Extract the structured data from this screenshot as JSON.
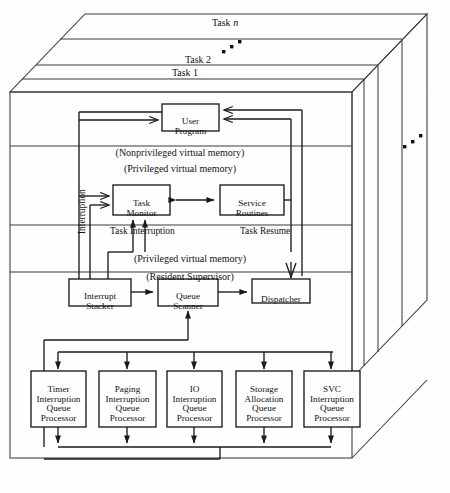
{
  "figure": {
    "kind": "layered-3d-architecture-diagram",
    "title_present": false
  },
  "stack": {
    "task_labels": [
      {
        "id": "task-n",
        "text": "Task",
        "suffix": "n",
        "italic_suffix": true
      },
      {
        "id": "task-2",
        "text": "Task 2"
      },
      {
        "id": "task-1",
        "text": "Task 1"
      }
    ],
    "ellipsis_marks": [
      "▪",
      "▪",
      "▪"
    ]
  },
  "memory_bands": [
    {
      "id": "nonpriv-virtual-memory",
      "text": "(Nonprivileged virtual memory)"
    },
    {
      "id": "priv-virtual-memory-upper",
      "text": "(Privileged virtual memory)"
    },
    {
      "id": "priv-virtual-memory-lower",
      "text": "(Privileged virtual memory)"
    },
    {
      "id": "resident-supervisor",
      "text": "(Resident Supervisor)"
    }
  ],
  "boxes": {
    "user_program": {
      "line1": "User",
      "line2": "Program"
    },
    "task_monitor": {
      "line1": "Task",
      "line2": "Monitor"
    },
    "service_routines": {
      "line1": "Service",
      "line2": "Routines"
    },
    "interrupt_stacker": {
      "line1": "Interrupt",
      "line2": "Stacker"
    },
    "queue_scanner": {
      "line1": "Queue",
      "line2": "Scanner"
    },
    "dispatcher": {
      "line1": "Dispatcher"
    }
  },
  "queue_processors": [
    {
      "id": "timer-interruption-queue-processor",
      "lines": [
        "Timer",
        "Interruption",
        "Queue",
        "Processor"
      ]
    },
    {
      "id": "paging-interruption-queue-processor",
      "lines": [
        "Paging",
        "Interruption",
        "Queue",
        "Processor"
      ]
    },
    {
      "id": "io-interruption-queue-processor",
      "lines": [
        "IO",
        "Interruption",
        "Queue",
        "Processor"
      ]
    },
    {
      "id": "storage-allocation-queue-processor",
      "lines": [
        "Storage",
        "Allocation",
        "Queue",
        "Processor"
      ]
    },
    {
      "id": "svc-interruption-queue-processor",
      "lines": [
        "SVC",
        "Interruption",
        "Queue",
        "Processor"
      ]
    }
  ],
  "flow_labels": {
    "interruption": "Interruption",
    "task_interruption": "Task Interruption",
    "task_resume": "Task Resume"
  },
  "colors": {
    "stroke": "#1a1a1a",
    "frame_stroke": "#3a3a3a",
    "background": "#fefefe",
    "text": "#111111"
  }
}
